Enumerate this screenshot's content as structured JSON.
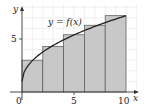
{
  "chart_data": {
    "type": "bar",
    "subtype": "riemann-sum-right-endpoints-with-curve",
    "title": "",
    "curve_label": "y = f(x)",
    "xlabel": "x",
    "ylabel": "y",
    "x_ticks": [
      "0",
      "5",
      "10"
    ],
    "y_ticks": [
      "5"
    ],
    "xlim": [
      0,
      10.5
    ],
    "ylim": [
      0,
      8.5
    ],
    "grid": true,
    "rectangles": [
      {
        "x0": 0,
        "x1": 2,
        "height": 3.0
      },
      {
        "x0": 2,
        "x1": 4,
        "height": 4.3
      },
      {
        "x0": 4,
        "x1": 6,
        "height": 5.4
      },
      {
        "x0": 6,
        "x1": 8,
        "height": 6.3
      },
      {
        "x0": 8,
        "x1": 10,
        "height": 7.2
      }
    ],
    "curve_points": [
      {
        "x": 0,
        "y": 1.0
      },
      {
        "x": 1,
        "y": 2.2
      },
      {
        "x": 2,
        "y": 3.0
      },
      {
        "x": 4,
        "y": 4.3
      },
      {
        "x": 6,
        "y": 5.4
      },
      {
        "x": 8,
        "y": 6.3
      },
      {
        "x": 10,
        "y": 7.2
      }
    ],
    "colors": {
      "rect_fill": "#c8c8c8",
      "rect_stroke": "#555555",
      "curve": "#222222",
      "grid": "#e6e6e6",
      "axis": "#333333"
    }
  },
  "labels": {
    "curve": "y = f(x)",
    "x_axis": "x",
    "y_axis": "y",
    "origin": "0",
    "x_tick_5": "5",
    "x_tick_10": "10",
    "y_tick_5": "5"
  }
}
